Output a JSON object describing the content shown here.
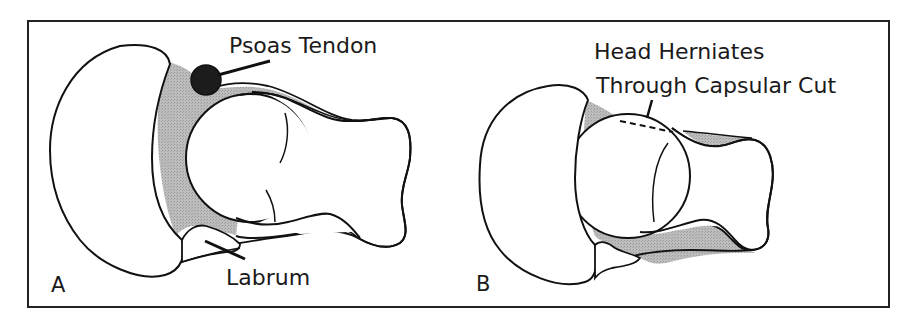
{
  "figure": {
    "panels": [
      {
        "id": "A",
        "letter": "A",
        "labels": {
          "psoas": "Psoas Tendon",
          "labrum": "Labrum"
        }
      },
      {
        "id": "B",
        "letter": "B",
        "labels": {
          "line1": "Head Herniates",
          "line2": "Through Capsular Cut"
        }
      }
    ],
    "colors": {
      "outline": "#111111",
      "capsule_fill": "#b9b9b9",
      "tendon_fill": "#1c1c1c",
      "background": "#ffffff"
    }
  }
}
